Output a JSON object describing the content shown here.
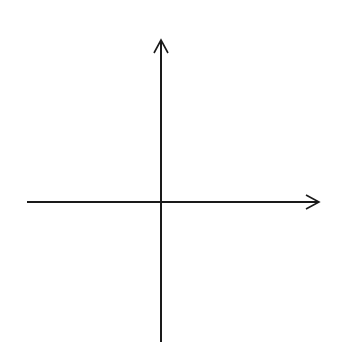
{
  "diagram": {
    "type": "coordinate-plane",
    "axes": {
      "x_label": "x",
      "y_label": "y",
      "x_range": [
        -6,
        6
      ],
      "y_range": [
        -6,
        6
      ],
      "x_ticks_negative": [
        "−5",
        "−4",
        "−3",
        "−2",
        "−1"
      ],
      "x_ticks_positive": [
        "1",
        "2",
        "3",
        "4",
        "5"
      ],
      "y_ticks_positive": [
        "5",
        "4",
        "3",
        "2",
        "1"
      ],
      "y_ticks_negative": [
        "−1",
        "−2",
        "−3",
        "−4",
        "−5"
      ]
    },
    "grid": {
      "style": "dotted",
      "columns": 12,
      "rows": 12,
      "color": "#8a8a8a"
    },
    "axis_color": "#1a1a1a"
  }
}
